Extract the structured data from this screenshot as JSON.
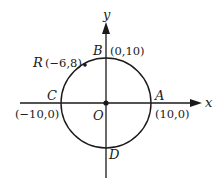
{
  "diagram": {
    "type": "coordinate-circle",
    "axes": {
      "x_label": "x",
      "y_label": "y"
    },
    "origin": {
      "label": "O"
    },
    "circle": {
      "center": "(0,0)",
      "radius": 10
    },
    "points": {
      "A": {
        "label": "A",
        "coords": "(10,0)"
      },
      "B": {
        "label": "B",
        "coords": "(0,10)"
      },
      "C": {
        "label": "C",
        "coords": "(−10,0)"
      },
      "D": {
        "label": "D"
      },
      "R": {
        "label": "R",
        "coords": "(−6,8)"
      }
    },
    "colors": {
      "stroke": "#1a1a1a",
      "background": "#ffffff"
    }
  }
}
